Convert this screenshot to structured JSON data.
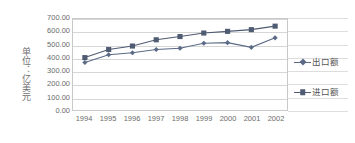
{
  "chart_data": {
    "type": "line",
    "title": "",
    "xlabel": "",
    "ylabel": "单位：亿美元",
    "categories": [
      "1994",
      "1995",
      "1996",
      "1997",
      "1998",
      "1999",
      "2000",
      "2001",
      "2002"
    ],
    "ylim": [
      0,
      700
    ],
    "ytick_values": [
      700,
      600,
      500,
      400,
      300,
      200,
      100,
      0
    ],
    "ytick_labels": [
      "700.00",
      "600.00",
      "500.00",
      "400.00",
      "300.00",
      "200.00",
      "100.00",
      "0.00"
    ],
    "grid": true,
    "legend_position": "right",
    "series": [
      {
        "name": "出口额",
        "marker": "diamond",
        "color": "#5b6a86",
        "values": [
          365,
          425,
          440,
          465,
          475,
          513,
          518,
          482,
          555
        ]
      },
      {
        "name": "进口额",
        "marker": "square",
        "color": "#4e5b72",
        "values": [
          403,
          465,
          492,
          540,
          565,
          592,
          605,
          618,
          645
        ]
      }
    ]
  },
  "colors": {
    "grid": "#d6d6d6",
    "axis": "#c9c9c9",
    "text": "#6b6b6b",
    "series_export": "#5b6a86",
    "series_import": "#4e5b72",
    "background": "#ffffff"
  }
}
